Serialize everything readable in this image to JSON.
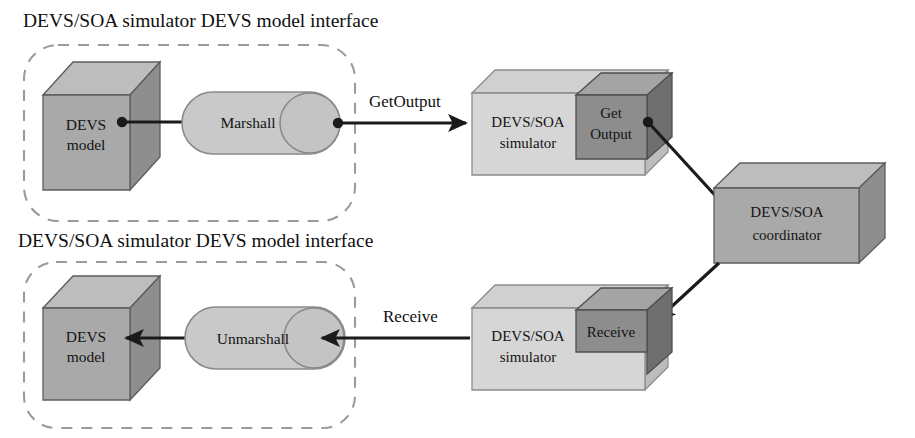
{
  "figure": {
    "title_top": "DEVS/SOA simulator DEVS model interface",
    "title_bottom": "DEVS/SOA simulator DEVS model interface"
  },
  "top_row": {
    "model_line1": "DEVS",
    "model_line2": "model",
    "interface_component": "Marshall",
    "edge_label": "GetOutput",
    "simulator_line1": "DEVS/SOA",
    "simulator_line2": "simulator",
    "service_line1": "Get",
    "service_line2": "Output"
  },
  "bottom_row": {
    "model_line1": "DEVS",
    "model_line2": "model",
    "interface_component": "Unmarshall",
    "edge_label": "Receive",
    "simulator_line1": "DEVS/SOA",
    "simulator_line2": "simulator",
    "service_line1": "Receive",
    "service_line2": ""
  },
  "coordinator": {
    "line1": "DEVS/SOA",
    "line2": "coordinator"
  },
  "colors": {
    "background": "#ffffff",
    "cube_front": "#a9a9a9",
    "cube_top": "#bdbdbd",
    "cube_side": "#8e8e8e",
    "box_light_front": "#d6d6d6",
    "box_light_top": "#d0d0d0",
    "box_light_side": "#bcbcbc",
    "box_dark_front": "#8d8d8d",
    "box_dark_top": "#a4a4a4",
    "box_dark_side": "#6f6f6f",
    "capsule_fill": "#c9c9c9",
    "dashed_border": "#9a9aa2",
    "connector": "#1a1a1a",
    "text": "#101010"
  }
}
